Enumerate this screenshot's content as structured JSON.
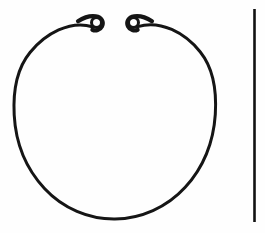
{
  "plate": {
    "title": "Line drawing of an open ring with coiled terminals",
    "background_color": "#fefefe",
    "ink_color": "#141414",
    "width": 265,
    "height": 233
  },
  "figure": {
    "name": "penannular-ring",
    "ink_color": "#151515",
    "stroke_width": 3.2,
    "circle": {
      "center_x": 115,
      "center_y": 119,
      "radius": 101,
      "left_x": 14,
      "right_x": 217,
      "top_y": 18,
      "bottom_y": 219,
      "gap_top_degrees": 22
    },
    "terminals": [
      {
        "name": "left-coil-terminal",
        "center_x": 96.5,
        "center_y": 22.5,
        "outer_diameter": 13,
        "hole_diameter": 6.5,
        "hole_color": "#fefefe"
      },
      {
        "name": "right-coil-terminal",
        "center_x": 133.5,
        "center_y": 22.5,
        "outer_diameter": 13,
        "hole_diameter": 6.5,
        "hole_color": "#fefefe"
      }
    ],
    "terminal_gap_px": 24
  },
  "scale_bar": {
    "name": "vertical-scale-bar",
    "x": 254.5,
    "top_y": 9,
    "bottom_y": 222,
    "length_px": 213,
    "thickness_px": 2.6,
    "ink_color": "#121212"
  },
  "caption": {
    "text": "",
    "color": "#c9c9c9",
    "visible": false
  }
}
